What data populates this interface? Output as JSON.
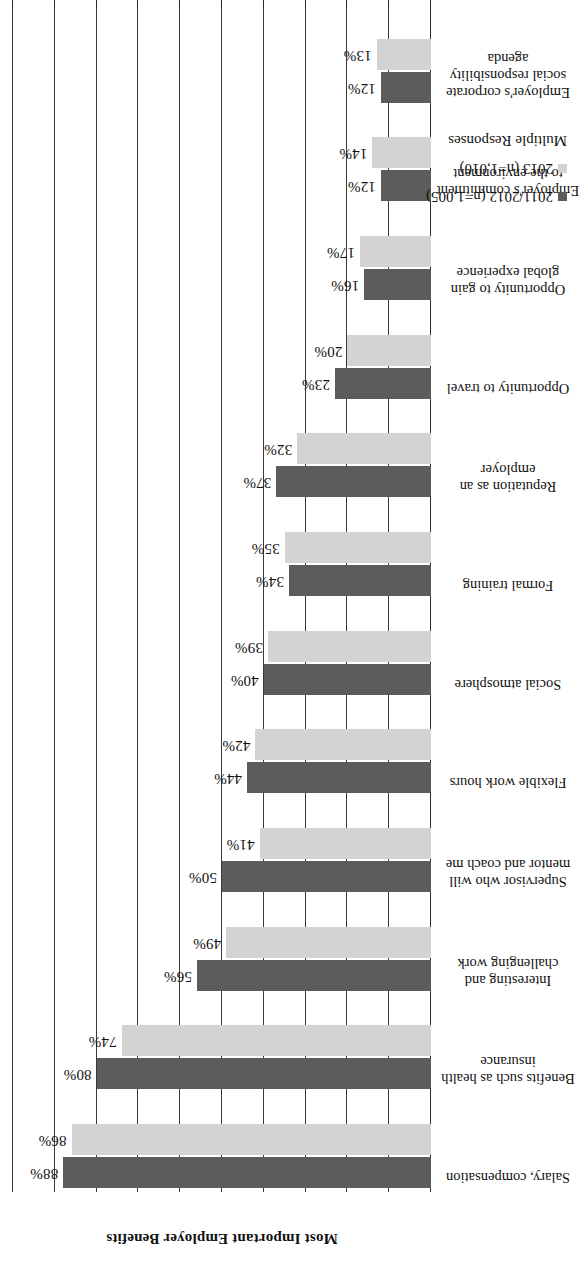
{
  "chart_data": {
    "type": "bar",
    "orientation": "horizontal",
    "title": "",
    "xlabel": "",
    "ylabel": "Most Important Employer Benefits",
    "xlim": [
      0,
      100
    ],
    "grid": true,
    "legend_position": "bottom-left",
    "value_suffix": "%",
    "tick_labels": [
      "0%",
      "10%",
      "20%",
      "30%",
      "40%",
      "50%",
      "60%",
      "70%",
      "80%",
      "90%",
      "100%"
    ],
    "tick_values": [
      0,
      10,
      20,
      30,
      40,
      50,
      60,
      70,
      80,
      90,
      100
    ],
    "categories": [
      "Salary, compensation",
      "Benefits such as health insurance",
      "Interesting and challenging work",
      "Supervisor who will mentor and coach me",
      "Flexible work hours",
      "Social atmosphere",
      "Formal training",
      "Reputation as an employer",
      "Opportunity to travel",
      "Opportunity to gain global experience",
      "Employer's commitment to the environment",
      "Employer's corporate social responsibility agenda"
    ],
    "series": [
      {
        "name": "2011/2012 (n=1,005)",
        "color": "#5c5c5c",
        "values": [
          88,
          80,
          56,
          50,
          44,
          40,
          34,
          37,
          23,
          16,
          12,
          12
        ],
        "labels": [
          "88%",
          "80%",
          "56%",
          "50%",
          "44%",
          "40%",
          "34%",
          "37%",
          "23%",
          "16%",
          "12%",
          "12%"
        ]
      },
      {
        "name": "2013 (n=1,010)",
        "color": "#d3d3d3",
        "values": [
          86,
          74,
          49,
          41,
          42,
          39,
          35,
          32,
          20,
          17,
          14,
          13
        ],
        "labels": [
          "86%",
          "74%",
          "49%",
          "41%",
          "42%",
          "39%",
          "35%",
          "32%",
          "20%",
          "17%",
          "14%",
          "13%"
        ]
      }
    ],
    "note": "Multiple Responses"
  }
}
